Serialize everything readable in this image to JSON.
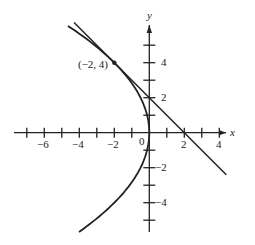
{
  "chart_data": {
    "type": "line",
    "title": "",
    "xlabel": "x",
    "ylabel": "y",
    "xlim": [
      -7.5,
      4.8
    ],
    "ylim": [
      -5.7,
      6.3
    ],
    "x_ticks": [
      -7,
      -6,
      -5,
      -4,
      -3,
      -2,
      -1,
      1,
      2,
      3,
      4
    ],
    "x_tick_labels": [
      "-6",
      "-4",
      "-2",
      "2",
      "4"
    ],
    "y_ticks": [
      -5,
      -4,
      -3,
      -2,
      -1,
      1,
      2,
      3,
      4,
      5
    ],
    "y_tick_labels": [
      "4",
      "2",
      "-2",
      "-4"
    ],
    "origin_label": "0",
    "grid": false,
    "series": [
      {
        "name": "parabola",
        "equation": "x = -y^2/8",
        "y_range": [
          -5.67,
          6.1
        ]
      },
      {
        "name": "tangent line",
        "equation": "y = -x + 2",
        "x_range": [
          -4.3,
          4.4
        ]
      }
    ],
    "annotations": [
      {
        "text": "(−2, 4)",
        "point": [
          -2,
          4
        ]
      }
    ]
  },
  "labels": {
    "x_axis": "x",
    "y_axis": "y",
    "origin": "0",
    "point": "(−2, 4)",
    "xt": [
      "−6",
      "−4",
      "−2",
      "2",
      "4"
    ],
    "yt": [
      "4",
      "2",
      "−2",
      "−4"
    ]
  }
}
